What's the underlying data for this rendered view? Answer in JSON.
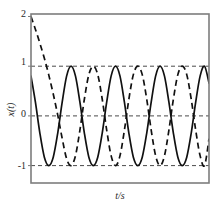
{
  "chart_data": {
    "type": "line",
    "title": "",
    "xlabel": "t/s",
    "ylabel": "x(t)",
    "xlim": [
      0,
      10
    ],
    "ylim": [
      -1.35,
      2.05
    ],
    "grid": true,
    "gridlines_y": [
      1,
      0,
      -1
    ],
    "legend": "none",
    "yticks": [
      {
        "value": 2,
        "label": "2"
      },
      {
        "value": 1,
        "label": "1"
      },
      {
        "value": 0,
        "label": "0"
      },
      {
        "value": -1,
        "label": "-1"
      }
    ],
    "xticks": [],
    "series": [
      {
        "name": "solid-response",
        "style": "solid",
        "color": "#111111",
        "width": 1.7,
        "description": "Steady sinusoid of unit amplitude starting near x=0.8 and falling, 5 full cycles across the record",
        "amplitude": 1.0,
        "period": 2.0,
        "phase_deg": 37,
        "offset": 0.0,
        "points_x": [
          0.0,
          0.25,
          0.5,
          0.75,
          1.0,
          1.25,
          1.5,
          1.75,
          2.0,
          2.25,
          2.5,
          2.75,
          3.0,
          3.25,
          3.5,
          3.75,
          4.0,
          4.25,
          4.5,
          4.75,
          5.0,
          5.25,
          5.5,
          5.75,
          6.0,
          6.25,
          6.5,
          6.75,
          7.0,
          7.25,
          7.5,
          7.75,
          8.0,
          8.25,
          8.5,
          8.75,
          9.0,
          9.25,
          9.5,
          9.75,
          10.0
        ],
        "points_y": [
          0.8,
          0.27,
          -0.35,
          -0.83,
          -1.0,
          -0.83,
          -0.35,
          0.27,
          0.8,
          1.0,
          0.8,
          0.27,
          -0.35,
          -0.83,
          -1.0,
          -0.83,
          -0.35,
          0.27,
          0.8,
          1.0,
          0.8,
          0.27,
          -0.35,
          -0.83,
          -1.0,
          -0.83,
          -0.35,
          0.27,
          0.8,
          1.0,
          0.8,
          0.27,
          -0.35,
          -0.83,
          -1.0,
          -0.83,
          -0.35,
          0.27,
          0.8,
          1.0,
          0.66
        ]
      },
      {
        "name": "dashed-response",
        "style": "dashed",
        "color": "#111111",
        "width": 1.7,
        "description": "Transient starting at x=2 at t=0, decaying into a unit sinusoid lagging the solid trace",
        "amplitude": 1.0,
        "period": 2.0,
        "initial_value": 2.0,
        "points_x": [
          0.0,
          0.25,
          0.5,
          0.75,
          1.0,
          1.25,
          1.5,
          1.75,
          2.0,
          2.25,
          2.5,
          2.75,
          3.0,
          3.25,
          3.5,
          3.75,
          4.0,
          4.25,
          4.5,
          4.75,
          5.0,
          5.25,
          5.5,
          5.75,
          6.0,
          6.25,
          6.5,
          6.75,
          7.0,
          7.25,
          7.5,
          7.75,
          8.0,
          8.25,
          8.5,
          8.75,
          9.0,
          9.25,
          9.5,
          9.75,
          10.0
        ],
        "points_y": [
          2.0,
          1.74,
          1.46,
          1.16,
          0.82,
          0.44,
          0.02,
          -0.45,
          -0.86,
          -1.0,
          -0.8,
          -0.28,
          0.34,
          0.83,
          1.0,
          0.83,
          0.34,
          -0.28,
          -0.8,
          -1.0,
          -0.8,
          -0.28,
          0.34,
          0.83,
          1.0,
          0.83,
          0.34,
          -0.28,
          -0.8,
          -1.0,
          -0.8,
          -0.28,
          0.34,
          0.83,
          1.0,
          0.83,
          0.34,
          -0.28,
          -0.8,
          -1.0,
          -0.46
        ]
      }
    ],
    "colors": {
      "frame": "#7d7d7d",
      "grid": "#4a4a4a",
      "curve": "#111111",
      "background": "#ffffff",
      "text": "#2a2a2a"
    }
  }
}
